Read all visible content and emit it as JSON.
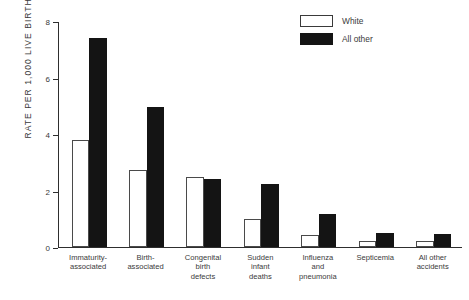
{
  "chart_data": {
    "type": "bar",
    "title": "",
    "xlabel": "",
    "ylabel": "RATE PER 1,000 LIVE BIRTHS",
    "ylim": [
      0,
      8
    ],
    "yticks": [
      0,
      2,
      4,
      6,
      8
    ],
    "ytick_labels": [
      "0",
      "2",
      "4",
      "6",
      "8"
    ],
    "grid": false,
    "legend_position": "top-right",
    "categories": [
      "Immaturity-\nassociated",
      "Birth-\nassociated",
      "Congenital\nbirth\ndefects",
      "Sudden\ninfant\ndeaths",
      "Influenza\nand\npneumonia",
      "Septicemia",
      "All other\naccidents"
    ],
    "series": [
      {
        "name": "White",
        "color": "#ffffff",
        "edge_color": "#4a4a4a",
        "values": [
          3.8,
          2.75,
          2.5,
          1.0,
          0.4,
          0.2,
          0.2
        ]
      },
      {
        "name": "All other",
        "color": "#141414",
        "edge_color": "#141414",
        "values": [
          7.45,
          5.0,
          2.4,
          2.25,
          1.15,
          0.5,
          0.45
        ]
      }
    ]
  },
  "legend": {
    "items": [
      {
        "label": "White",
        "swatch": "white-open-square"
      },
      {
        "label": "All other",
        "swatch": "black-filled-square"
      }
    ]
  },
  "axis": {
    "y_title": "RATE PER 1,000 LIVE BIRTHS",
    "y_max_label": "8",
    "y_min_label": "0"
  }
}
